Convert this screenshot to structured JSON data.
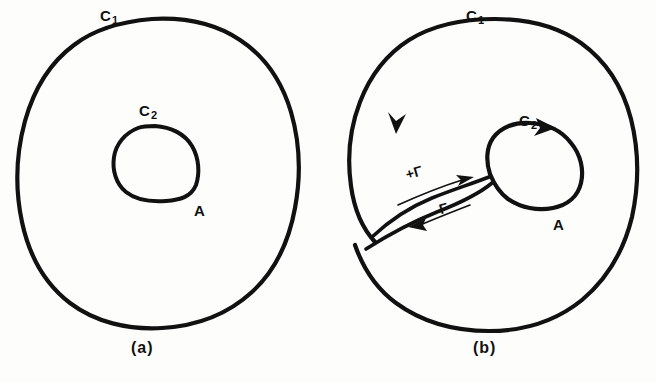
{
  "figure": {
    "type": "hand-drawn-math-diagram",
    "ink_color": "#111111",
    "background_color": "#fdfdfc",
    "panels": [
      {
        "id": "a",
        "caption": "(a)",
        "outer_curve_label": "C",
        "outer_curve_subscript": "1",
        "inner_curve_label": "C",
        "inner_curve_subscript": "2",
        "region_label": "A",
        "oriented": false
      },
      {
        "id": "b",
        "caption": "(b)",
        "outer_curve_label": "C",
        "outer_curve_subscript": "1",
        "inner_curve_label": "C",
        "inner_curve_subscript": "2",
        "region_label": "A",
        "oriented": true,
        "cut_labels": {
          "forward": "+Γ",
          "backward": "-Γ"
        }
      }
    ]
  }
}
